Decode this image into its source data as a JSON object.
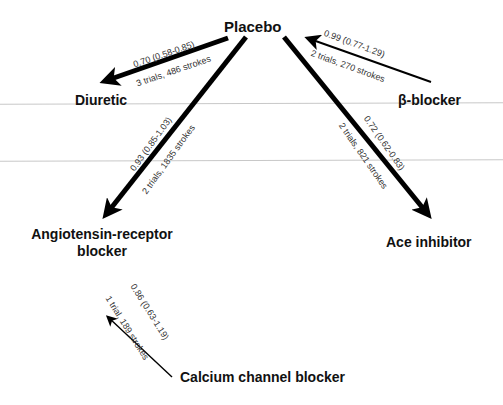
{
  "diagram": {
    "type": "network-meta-analysis",
    "nodes": {
      "placebo": "Placebo",
      "diuretic": "Diuretic",
      "beta_blocker": "β-blocker",
      "arb_line1": "Angiotensin-receptor",
      "arb_line2": "blocker",
      "ace": "Ace inhibitor",
      "ccb": "Calcium channel blocker"
    },
    "edges": [
      {
        "from": "Placebo",
        "to": "Diuretic",
        "estimate": "0.70 (0.58-0.85)",
        "evidence": "3 trials, 486 strokes",
        "weight": "thick"
      },
      {
        "from": "β-blocker",
        "to": "Placebo",
        "estimate": "0.99 (0.77-1.29)",
        "evidence": "2 trials, 270 strokes",
        "weight": "thin"
      },
      {
        "from": "Placebo",
        "to": "Angiotensin-receptor blocker",
        "estimate": "0.93 (0.85-1.03)",
        "evidence": "2 trials, 1835 strokes",
        "weight": "thick"
      },
      {
        "from": "Placebo",
        "to": "Ace inhibitor",
        "estimate": "0.72 (0.62-0.83)",
        "evidence": "2 trials, 821 strokes",
        "weight": "thick"
      },
      {
        "from": "Calcium channel blocker",
        "to": "Angiotensin-receptor blocker",
        "estimate": "0.86 (0.63-1.19)",
        "evidence": "1 trial, 189 strokes",
        "weight": "thin"
      }
    ],
    "colors": {
      "arrow": "#000000",
      "text": "#111111",
      "label": "#333333",
      "scanline": "#c8c8c8"
    }
  }
}
